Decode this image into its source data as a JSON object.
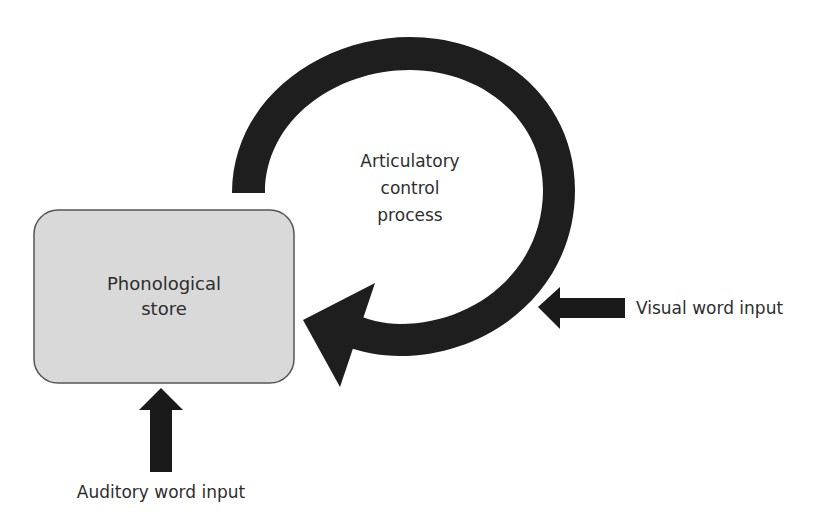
{
  "diagram": {
    "type": "phonological-loop-model",
    "phonological_store": {
      "label_line1": "Phonological",
      "label_line2": "store",
      "fill": "#d9d9d9",
      "border": "#555555"
    },
    "articulatory_loop": {
      "label_line1": "Articulatory",
      "label_line2": "control",
      "label_line3": "process",
      "color": "#1e1e1e"
    },
    "inputs": {
      "visual": {
        "label": "Visual word input",
        "direction": "left"
      },
      "auditory": {
        "label": "Auditory word input",
        "direction": "up"
      }
    }
  }
}
